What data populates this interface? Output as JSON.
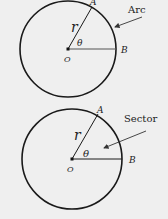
{
  "figures": [
    {
      "id": "arc",
      "callout": "Arc",
      "radius_label": "r",
      "angle_label": "θ",
      "center_label": "O",
      "point_a_label": "A",
      "point_b_label": "B"
    },
    {
      "id": "sector",
      "callout": "Sector",
      "radius_label": "r",
      "angle_label": "θ",
      "center_label": "O",
      "point_a_label": "A",
      "point_b_label": "B"
    }
  ],
  "colors": {
    "background": "#efefef",
    "stroke": "#1a1a1a",
    "text": "#222222"
  }
}
